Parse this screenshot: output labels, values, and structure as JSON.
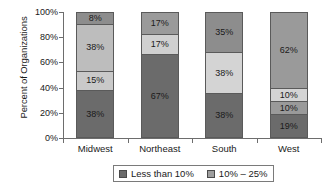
{
  "chart_data": {
    "type": "bar",
    "subtype": "100-percent-stacked-column",
    "title": "",
    "xlabel": "",
    "ylabel": "Percent of Organizations",
    "ylim": [
      0,
      100
    ],
    "ytick_labels": [
      "0%",
      "20%",
      "40%",
      "60%",
      "80%",
      "100%"
    ],
    "ytick_values": [
      0,
      20,
      40,
      60,
      80,
      100
    ],
    "grid": false,
    "legend_position": "bottom",
    "categories": [
      "Midwest",
      "Northeast",
      "South",
      "West"
    ],
    "series": [
      {
        "name": "Less than 10%",
        "color": "#6b6b6b",
        "values": [
          38,
          67,
          38,
          19
        ],
        "labels": [
          "38%",
          "67%",
          "38%",
          "19%"
        ]
      },
      {
        "name": "10% – 25%",
        "color": "#a8a8a8",
        "values": [
          15,
          17,
          0,
          10
        ],
        "labels": [
          "15%",
          "17%",
          "",
          "10%"
        ]
      },
      {
        "name": "segment-3",
        "color": "#d4d4d4",
        "values": [
          38,
          17,
          38,
          10
        ],
        "labels": [
          "38%",
          "17%",
          "38%",
          "10%"
        ]
      },
      {
        "name": "segment-4",
        "color": "#9a9a9a",
        "values": [
          8,
          0,
          35,
          62
        ],
        "labels": [
          "8%",
          "",
          "35%",
          "62%"
        ]
      }
    ],
    "bars": [
      {
        "category": "Midwest",
        "stack": [
          {
            "label": "38%",
            "value": 38,
            "color": "#6b6b6b"
          },
          {
            "label": "15%",
            "value": 15,
            "color": "#c9c9c9"
          },
          {
            "label": "38%",
            "value": 38,
            "color": "#bdbdbd"
          },
          {
            "label": "8%",
            "value": 9,
            "color": "#8d8d8d"
          }
        ]
      },
      {
        "category": "Northeast",
        "stack": [
          {
            "label": "67%",
            "value": 67,
            "color": "#6b6b6b"
          },
          {
            "label": "17%",
            "value": 16,
            "color": "#d0d0d0"
          },
          {
            "label": "17%",
            "value": 17,
            "color": "#9a9a9a"
          }
        ]
      },
      {
        "category": "South",
        "stack": [
          {
            "label": "38%",
            "value": 35,
            "color": "#6b6b6b"
          },
          {
            "label": "38%",
            "value": 33,
            "color": "#d4d4d4"
          },
          {
            "label": "35%",
            "value": 32,
            "color": "#8d8d8d"
          }
        ]
      },
      {
        "category": "West",
        "stack": [
          {
            "label": "19%",
            "value": 18,
            "color": "#6b6b6b"
          },
          {
            "label": "10%",
            "value": 10,
            "color": "#9a9a9a"
          },
          {
            "label": "10%",
            "value": 10,
            "color": "#d4d4d4"
          },
          {
            "label": "62%",
            "value": 62,
            "color": "#9a9a9a"
          }
        ]
      }
    ],
    "legend": [
      {
        "label": "Less than 10%",
        "color": "#6b6b6b"
      },
      {
        "label": "10% – 25%",
        "color": "#9e9e9e"
      }
    ]
  },
  "axis": {
    "y_title": "Percent of Organizations"
  }
}
